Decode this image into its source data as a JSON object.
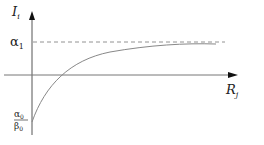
{
  "diagram": {
    "y_axis": {
      "label": "I",
      "label_sub": "i"
    },
    "x_axis": {
      "label": "R",
      "label_sub": "j"
    },
    "asymptote": {
      "label": "α",
      "label_sub": "1",
      "style": "dashed"
    },
    "intercept": {
      "numerator": "α",
      "numerator_sub": "0",
      "denominator": "β",
      "denominator_sub": "0"
    },
    "curve": {
      "description": "increasing concave curve from intercept approaching asymptote"
    },
    "colors": {
      "axis": "#555555",
      "curve": "#888888",
      "dash": "#777777"
    }
  }
}
